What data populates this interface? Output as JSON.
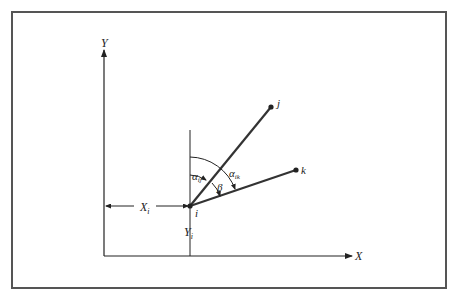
{
  "diagram": {
    "axes": {
      "y_label": "Y",
      "x_label": "X"
    },
    "points": {
      "i": "i",
      "j": "j",
      "k": "k"
    },
    "dimensions": {
      "xi": "X",
      "xi_sub": "i",
      "yi": "Y",
      "yi_sub": "i"
    },
    "angles": {
      "alpha_ij": "α",
      "alpha_ij_sub": "ij",
      "alpha_ik": "α",
      "alpha_ik_sub": "ik",
      "beta": "β"
    }
  }
}
